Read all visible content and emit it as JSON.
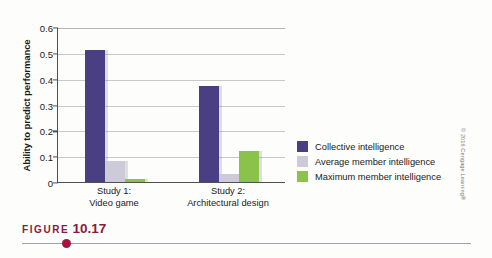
{
  "figure": {
    "word": "FIGURE",
    "number": "10.17"
  },
  "copyright": "© 2016 Cengage Learning®",
  "colors": {
    "collective": "#4a3f82",
    "average": "#cdcbd9",
    "maximum": "#8bc34a",
    "axis": "#4f4f4f",
    "grid": "#c9c9c9",
    "caption": "#8c1a3a",
    "dot": "#a8123e"
  },
  "chart_data": {
    "type": "bar",
    "title": "",
    "xlabel": "",
    "ylabel": "Ability to predict performance",
    "ylim": [
      0,
      0.6
    ],
    "yticks": [
      0,
      0.1,
      0.2,
      0.3,
      0.4,
      0.5,
      0.6
    ],
    "ytick_labels": [
      "0",
      "0.1",
      "0.2",
      "0.3",
      "0.4",
      "0.5",
      "0.6"
    ],
    "grid": true,
    "legend_position": "right",
    "categories": [
      "Study 1:\nVideo game",
      "Study 2:\nArchitectural design"
    ],
    "category_lines": [
      [
        "Study 1:",
        "Video game"
      ],
      [
        "Study 2:",
        "Architectural design"
      ]
    ],
    "series": [
      {
        "name": "Collective intelligence",
        "color": "#4a3f82",
        "values": [
          0.51,
          0.37
        ]
      },
      {
        "name": "Average member intelligence",
        "color": "#cdcbd9",
        "values": [
          0.08,
          0.03
        ]
      },
      {
        "name": "Maximum member intelligence",
        "color": "#8bc34a",
        "values": [
          0.01,
          0.12
        ]
      }
    ]
  }
}
